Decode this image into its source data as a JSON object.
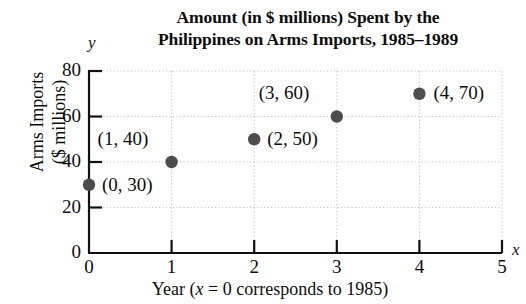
{
  "chart_data": {
    "type": "scatter",
    "title": "Amount (in $ millions) Spent by the\nPhilippines on Arms Imports, 1985–1989",
    "xlabel": "Year (x = 0 corresponds to 1985)",
    "ylabel": "Arms Imports\n($ millions)",
    "x_axis_letter": "y",
    "y_axis_letter": "x",
    "x": [
      0,
      1,
      2,
      3,
      4
    ],
    "values": [
      30,
      40,
      50,
      60,
      70
    ],
    "point_labels": [
      "(0, 30)",
      "(1, 40)",
      "(2, 50)",
      "(3, 60)",
      "(4, 70)"
    ],
    "xlim": [
      0,
      5
    ],
    "ylim": [
      0,
      80
    ],
    "xticks": [
      "0",
      "1",
      "2",
      "3",
      "4",
      "5"
    ],
    "yticks": [
      "0",
      "20",
      "40",
      "60",
      "80"
    ],
    "grid": true,
    "legend": "none",
    "point_color": "#4d4d4d",
    "axis_color": "#111111",
    "grid_color": "#bdbdbd",
    "background": "#ffffff"
  },
  "axis_letters": {
    "y": "y",
    "x": "x"
  }
}
